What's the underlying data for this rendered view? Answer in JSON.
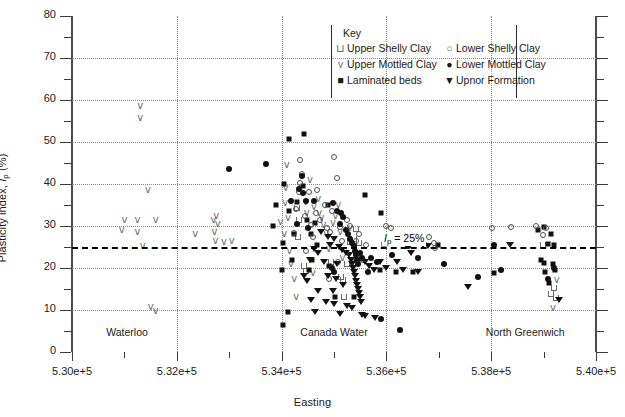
{
  "chart_data": {
    "type": "scatter",
    "title": "",
    "xlabel": "Easting",
    "ylabel": "Plasticity index, Ip (%)",
    "xlim": [
      530000,
      540000
    ],
    "ylim": [
      0,
      80
    ],
    "xticks": [
      530000,
      532000,
      534000,
      536000,
      538000,
      540000
    ],
    "xticklabels": [
      "5.30e+5",
      "5.32e+5",
      "5.34e+5",
      "5.36e+5",
      "5.38e+5",
      "5.40e+5"
    ],
    "yticks": [
      0,
      10,
      20,
      30,
      40,
      50,
      60,
      70,
      80
    ],
    "yticklabels": [
      "0",
      "10",
      "20",
      "30",
      "40",
      "50",
      "60",
      "70",
      "80"
    ],
    "yminorticks": [
      5,
      15,
      25,
      35,
      45,
      55,
      65,
      75
    ],
    "grid": "dotted",
    "legend_position": "top-center",
    "reference_line": {
      "value": 25,
      "label": "Ip = 25%",
      "style": "dashed"
    },
    "annotations": [
      {
        "text": "Waterloo",
        "x": 531050,
        "y": 4.5
      },
      {
        "text": "Canada Water",
        "x": 535000,
        "y": 4.5
      },
      {
        "text": "North Greenwich",
        "x": 538650,
        "y": 4.5
      }
    ],
    "series": [
      {
        "name": "Upper Shelly Clay",
        "marker": "open-u",
        "points": [
          [
            534420,
            20.5
          ],
          [
            534460,
            19.3
          ],
          [
            535130,
            17.8
          ],
          [
            535180,
            17.2
          ],
          [
            535240,
            21.0
          ],
          [
            535310,
            26.2
          ],
          [
            535380,
            26.8
          ],
          [
            535200,
            13.0
          ],
          [
            534950,
            21.5
          ],
          [
            539150,
            13.8
          ],
          [
            539230,
            12.8
          ],
          [
            539200,
            15.2
          ],
          [
            534310,
            27.3
          ],
          [
            534330,
            31.5
          ],
          [
            534290,
            34.2
          ],
          [
            535420,
            29.4
          ],
          [
            535480,
            26.0
          ],
          [
            538980,
            25.4
          ]
        ]
      },
      {
        "name": "Upper Mottled Clay",
        "marker": "open-v",
        "points": [
          [
            531300,
            58.5
          ],
          [
            531300,
            55.8
          ],
          [
            531450,
            38.5
          ],
          [
            531000,
            31.5
          ],
          [
            531250,
            31.5
          ],
          [
            531600,
            31.5
          ],
          [
            531250,
            28.5
          ],
          [
            530950,
            29.0
          ],
          [
            531350,
            25.3
          ],
          [
            531500,
            10.8
          ],
          [
            531600,
            9.8
          ],
          [
            532350,
            28.0
          ],
          [
            532700,
            31.5
          ],
          [
            532780,
            30.5
          ],
          [
            532750,
            32.3
          ],
          [
            532720,
            28.5
          ],
          [
            532740,
            26.5
          ],
          [
            532900,
            26.3
          ],
          [
            533050,
            26.5
          ],
          [
            534100,
            44.5
          ],
          [
            534080,
            39.0
          ],
          [
            534070,
            35.5
          ],
          [
            534120,
            32.0
          ],
          [
            533980,
            31.0
          ],
          [
            534050,
            28.0
          ],
          [
            534150,
            24.0
          ],
          [
            534460,
            35.8
          ],
          [
            534480,
            33.0
          ],
          [
            534540,
            41.0
          ],
          [
            534620,
            34.5
          ],
          [
            534700,
            36.5
          ],
          [
            534720,
            33.2
          ],
          [
            534760,
            31.8
          ],
          [
            534800,
            30.2
          ],
          [
            534850,
            28.0
          ],
          [
            534900,
            24.5
          ],
          [
            534980,
            30.8
          ],
          [
            535030,
            32.5
          ],
          [
            535080,
            35.0
          ],
          [
            535120,
            28.5
          ],
          [
            535160,
            22.3
          ],
          [
            535300,
            29.5
          ],
          [
            535350,
            22.0
          ],
          [
            535520,
            22.2
          ],
          [
            534180,
            21.0
          ],
          [
            534240,
            17.5
          ],
          [
            534600,
            18.8
          ],
          [
            534280,
            13.0
          ],
          [
            539180,
            10.5
          ],
          [
            539250,
            17.2
          ]
        ]
      },
      {
        "name": "Laminated beds",
        "marker": "filled-square",
        "points": [
          [
            534150,
            50.8
          ],
          [
            534420,
            51.8
          ],
          [
            534050,
            40.0
          ],
          [
            534400,
            39.5
          ],
          [
            533900,
            35.0
          ],
          [
            534300,
            35.8
          ],
          [
            534140,
            33.5
          ],
          [
            533830,
            30.0
          ],
          [
            534480,
            31.5
          ],
          [
            534640,
            30.8
          ],
          [
            534880,
            35.0
          ],
          [
            535600,
            37.5
          ],
          [
            535900,
            33.0
          ],
          [
            534240,
            28.0
          ],
          [
            534560,
            28.0
          ],
          [
            534020,
            26.0
          ],
          [
            534680,
            25.5
          ],
          [
            535950,
            25.8
          ],
          [
            536350,
            26.0
          ],
          [
            534200,
            22.0
          ],
          [
            534580,
            22.0
          ],
          [
            534000,
            19.5
          ],
          [
            536500,
            19.0
          ],
          [
            535880,
            19.5
          ],
          [
            534900,
            20.5
          ],
          [
            536180,
            19.0
          ],
          [
            538050,
            18.8
          ],
          [
            538900,
            29.0
          ],
          [
            539000,
            29.8
          ],
          [
            539150,
            28.0
          ],
          [
            539080,
            25.7
          ],
          [
            539200,
            25.5
          ],
          [
            539000,
            21.2
          ],
          [
            539180,
            21.0
          ],
          [
            539220,
            19.5
          ],
          [
            539020,
            19.0
          ],
          [
            539100,
            16.5
          ],
          [
            534030,
            6.5
          ],
          [
            535020,
            13.0
          ],
          [
            535380,
            13.2
          ],
          [
            534120,
            9.5
          ],
          [
            534520,
            19.5
          ],
          [
            536980,
            25.4
          ],
          [
            538950,
            22.0
          ]
        ]
      },
      {
        "name": "Lower Shelly Clay",
        "marker": "open-circle",
        "points": [
          [
            534350,
            45.8
          ],
          [
            534380,
            42.5
          ],
          [
            534360,
            40.2
          ],
          [
            534340,
            38.0
          ],
          [
            535000,
            46.5
          ],
          [
            535050,
            41.5
          ],
          [
            534680,
            38.5
          ],
          [
            534520,
            38.0
          ],
          [
            534820,
            35.0
          ],
          [
            534280,
            34.0
          ],
          [
            534660,
            33.0
          ],
          [
            534960,
            33.5
          ],
          [
            534440,
            32.5
          ],
          [
            534740,
            31.5
          ],
          [
            535240,
            31.5
          ],
          [
            535300,
            30.0
          ],
          [
            534560,
            30.3
          ],
          [
            534860,
            29.5
          ],
          [
            534920,
            28.5
          ],
          [
            535110,
            29.8
          ],
          [
            535480,
            28.0
          ],
          [
            536000,
            30.0
          ],
          [
            536080,
            29.5
          ],
          [
            534240,
            28.3
          ],
          [
            534600,
            27.5
          ],
          [
            535150,
            26.5
          ],
          [
            535420,
            26.5
          ],
          [
            535620,
            25.5
          ],
          [
            536820,
            27.5
          ],
          [
            536900,
            26.0
          ],
          [
            536920,
            24.8
          ],
          [
            538020,
            29.5
          ],
          [
            538380,
            29.8
          ],
          [
            538850,
            30.0
          ],
          [
            539050,
            29.5
          ],
          [
            535080,
            21.5
          ],
          [
            534460,
            24.0
          ],
          [
            535560,
            22.0
          ],
          [
            534900,
            17.5
          ],
          [
            538980,
            27.8
          ]
        ]
      },
      {
        "name": "Lower Mottled Clay",
        "marker": "filled-circle",
        "points": [
          [
            533000,
            43.5
          ],
          [
            533700,
            44.8
          ],
          [
            534380,
            41.8
          ],
          [
            534340,
            38.8
          ],
          [
            534410,
            37.8
          ],
          [
            534180,
            36.0
          ],
          [
            534460,
            36.0
          ],
          [
            534620,
            36.0
          ],
          [
            534980,
            35.5
          ],
          [
            535060,
            33.5
          ],
          [
            535140,
            33.0
          ],
          [
            535180,
            32.2
          ],
          [
            535120,
            30.5
          ],
          [
            534290,
            30.5
          ],
          [
            534500,
            29.5
          ],
          [
            535220,
            29.0
          ],
          [
            535260,
            28.2
          ],
          [
            535300,
            27.0
          ],
          [
            535340,
            26.0
          ],
          [
            535380,
            25.2
          ],
          [
            535400,
            24.0
          ],
          [
            535420,
            23.0
          ],
          [
            535440,
            22.0
          ],
          [
            535460,
            21.0
          ],
          [
            535500,
            23.5
          ],
          [
            535540,
            22.5
          ],
          [
            535700,
            22.5
          ],
          [
            535820,
            21.5
          ],
          [
            536100,
            23.0
          ],
          [
            536420,
            25.2
          ],
          [
            536600,
            22.5
          ],
          [
            537100,
            21.0
          ],
          [
            537750,
            17.8
          ],
          [
            538180,
            19.5
          ],
          [
            539080,
            17.5
          ],
          [
            539200,
            20.0
          ],
          [
            535900,
            7.8
          ],
          [
            536250,
            5.2
          ],
          [
            534960,
            20.0
          ],
          [
            535000,
            19.0
          ],
          [
            538050,
            25.4
          ],
          [
            535640,
            19.0
          ]
        ]
      },
      {
        "name": "Upnor Formation",
        "marker": "filled-triangle",
        "points": [
          [
            534760,
            28.5
          ],
          [
            534880,
            27.5
          ],
          [
            535000,
            27.0
          ],
          [
            534920,
            25.5
          ],
          [
            535100,
            25.0
          ],
          [
            535160,
            24.2
          ],
          [
            535220,
            23.5
          ],
          [
            535280,
            23.0
          ],
          [
            535320,
            22.0
          ],
          [
            535340,
            21.0
          ],
          [
            535360,
            20.0
          ],
          [
            535380,
            19.0
          ],
          [
            535400,
            18.0
          ],
          [
            535420,
            17.0
          ],
          [
            535440,
            16.0
          ],
          [
            535460,
            15.0
          ],
          [
            535480,
            14.0
          ],
          [
            535500,
            13.0
          ],
          [
            535520,
            12.0
          ],
          [
            534620,
            24.5
          ],
          [
            534700,
            23.5
          ],
          [
            534540,
            21.8
          ],
          [
            534800,
            21.5
          ],
          [
            535050,
            21.0
          ],
          [
            535600,
            21.5
          ],
          [
            535660,
            20.5
          ],
          [
            535760,
            19.5
          ],
          [
            535880,
            21.5
          ],
          [
            536000,
            20.0
          ],
          [
            536200,
            21.5
          ],
          [
            536320,
            19.5
          ],
          [
            536460,
            23.5
          ],
          [
            536600,
            19.0
          ],
          [
            536700,
            25.5
          ],
          [
            534420,
            18.0
          ],
          [
            534480,
            17.0
          ],
          [
            534880,
            18.0
          ],
          [
            535040,
            17.5
          ],
          [
            535180,
            16.0
          ],
          [
            534980,
            14.5
          ],
          [
            535240,
            11.0
          ],
          [
            535340,
            10.5
          ],
          [
            535120,
            9.0
          ],
          [
            534700,
            14.5
          ],
          [
            534850,
            12.0
          ],
          [
            535000,
            11.5
          ],
          [
            536800,
            25.2
          ],
          [
            537550,
            15.5
          ],
          [
            538350,
            25.5
          ],
          [
            535540,
            8.8
          ],
          [
            535600,
            8.5
          ],
          [
            535780,
            8.2
          ],
          [
            539300,
            12.5
          ],
          [
            534640,
            9.5
          ],
          [
            534560,
            12.5
          ]
        ]
      }
    ]
  },
  "legend": {
    "title": "Key",
    "entries": [
      {
        "label": "Upper Shelly Clay",
        "marker": "open-u"
      },
      {
        "label": "Upper Mottled Clay",
        "marker": "open-v"
      },
      {
        "label": "Laminated beds",
        "marker": "filled-square"
      },
      {
        "label": "Lower Shelly Clay",
        "marker": "open-circle"
      },
      {
        "label": "Lower Mottled Clay",
        "marker": "filled-circle"
      },
      {
        "label": "Upnor Formation",
        "marker": "filled-triangle"
      }
    ]
  },
  "colors": {
    "marker_dark": "#111111",
    "marker_open": "#6a6a6a",
    "axis": "#3a3a3a",
    "grid": "#8a8a8a"
  }
}
